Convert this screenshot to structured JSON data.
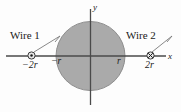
{
  "figure": {
    "background_color": "#fdfdfd",
    "axes": {
      "x_label": "x",
      "y_label": "y",
      "axis_color": "#4a4a4a"
    },
    "region": {
      "name": "shaded-circle",
      "fill_color": "#aaaaaa",
      "stroke_color": "#8e8e8e",
      "radius_label": "r"
    },
    "ticks": [
      {
        "name": "tick-neg-r",
        "label": "−r",
        "x_value": -1
      },
      {
        "name": "tick-pos-r",
        "label": "r",
        "x_value": 1
      }
    ],
    "wires": [
      {
        "name": "wire-1",
        "label": "Wire 1",
        "position_label": "−2r",
        "x_value": -2,
        "current_direction": "out-of-page",
        "symbol": "circle-dot-icon"
      },
      {
        "name": "wire-2",
        "label": "Wire 2",
        "position_label": "2r",
        "x_value": 2,
        "current_direction": "into-page",
        "symbol": "circle-cross-icon"
      }
    ]
  }
}
